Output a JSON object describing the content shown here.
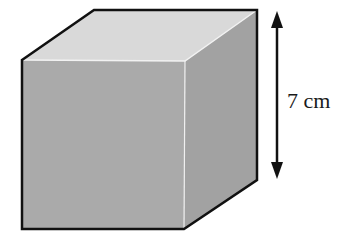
{
  "figure": {
    "type": "cube",
    "dimension_label": {
      "value": "7",
      "unit": "cm",
      "text": "7 cm"
    },
    "colors": {
      "top_face": "#d9d9d9",
      "front_face": "#aaaaaa",
      "right_face": "#a2a2a2",
      "edge": "#111111",
      "highlight_edge": "#f2f2f2",
      "arrow": "#111111"
    }
  }
}
